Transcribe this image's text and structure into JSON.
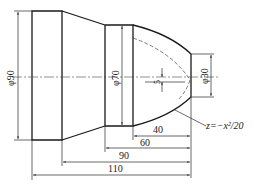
{
  "drawing": {
    "type": "turned shaft part drawing",
    "diameters": {
      "large": "φ90",
      "middle": "φ70",
      "end": "φ30"
    },
    "lengths": {
      "d40": "40",
      "d60": "60",
      "d90": "90",
      "d110": "110"
    },
    "offset_label": "5",
    "curve_equation": "z=−x²/20"
  }
}
